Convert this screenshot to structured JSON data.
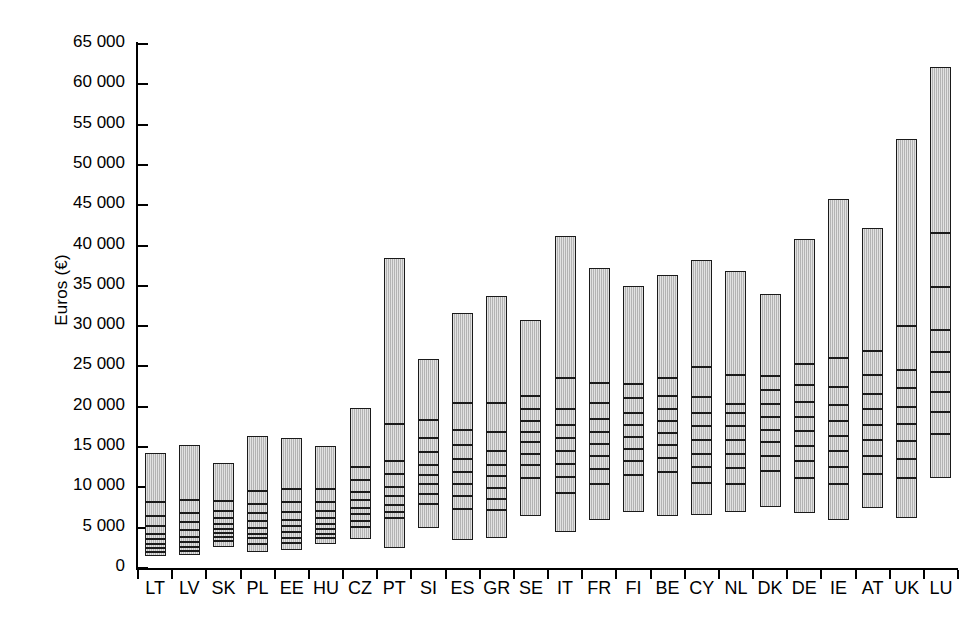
{
  "chart": {
    "ylabel": "Euros (€)",
    "xlabel": "",
    "ytick_labels": [
      "0",
      "5 000",
      "10 000",
      "15 000",
      "20 000",
      "25 000",
      "30 000",
      "35 000",
      "40 000",
      "45 000",
      "50 000",
      "55 000",
      "60 000",
      "65 000"
    ],
    "bar_fill_color": "#bfbfbf",
    "bar_edge_color": "#1a1a1a",
    "axis_color": "#000000",
    "background_color": "#ffffff"
  },
  "chart_data": {
    "type": "bar",
    "title": "",
    "subtitle": "",
    "xlabel": "",
    "ylabel": "Euros (€)",
    "ylim": [
      0,
      65000
    ],
    "ytick_values": [
      0,
      5000,
      10000,
      15000,
      20000,
      25000,
      30000,
      35000,
      40000,
      45000,
      50000,
      55000,
      60000,
      65000
    ],
    "ytick_labels": [
      "0",
      "5 000",
      "10 000",
      "15 000",
      "20 000",
      "25 000",
      "30 000",
      "35 000",
      "40 000",
      "45 000",
      "50 000",
      "55 000",
      "60 000",
      "65 000"
    ],
    "grid": false,
    "legend": null,
    "annotations": [],
    "note": "Floating range bars: each bar spans from the 1st decile to the 10th decile of earnings; internal horizontal lines mark intermediate deciles.",
    "categories": [
      "LT",
      "LV",
      "SK",
      "PL",
      "EE",
      "HU",
      "CZ",
      "PT",
      "SI",
      "ES",
      "GR",
      "SE",
      "IT",
      "FR",
      "FI",
      "BE",
      "CY",
      "NL",
      "DK",
      "DE",
      "IE",
      "AT",
      "UK",
      "LU"
    ],
    "series": [
      {
        "name": "Earnings decile range",
        "bars": [
          {
            "category": "LT",
            "low": 1500,
            "high": 14300,
            "deciles": [
              2100,
              2600,
              3100,
              3700,
              4400,
              5300,
              6600,
              8300
            ]
          },
          {
            "category": "LV",
            "low": 1600,
            "high": 15200,
            "deciles": [
              2200,
              2700,
              3300,
              4000,
              4800,
              5800,
              7000,
              8500
            ]
          },
          {
            "category": "SK",
            "low": 2600,
            "high": 13000,
            "deciles": [
              3500,
              4000,
              4500,
              5000,
              5600,
              6300,
              7200,
              8400
            ]
          },
          {
            "category": "PL",
            "low": 2000,
            "high": 16400,
            "deciles": [
              3100,
              3800,
              4400,
              5100,
              5900,
              6900,
              8100,
              9700
            ]
          },
          {
            "category": "EE",
            "low": 2200,
            "high": 16100,
            "deciles": [
              3200,
              3900,
              4600,
              5300,
              6100,
              7100,
              8300,
              9900
            ]
          },
          {
            "category": "HU",
            "low": 3000,
            "high": 15100,
            "deciles": [
              3900,
              4400,
              5000,
              5600,
              6300,
              7200,
              8300,
              9900
            ]
          },
          {
            "category": "CZ",
            "low": 3600,
            "high": 19800,
            "deciles": [
              5200,
              6000,
              6800,
              7600,
              8500,
              9600,
              11000,
              12600
            ]
          },
          {
            "category": "PT",
            "low": 2500,
            "high": 38500,
            "deciles": [
              6300,
              7100,
              8000,
              9000,
              10200,
              11800,
              13400,
              18000
            ]
          },
          {
            "category": "SI",
            "low": 5000,
            "high": 25900,
            "deciles": [
              8100,
              9300,
              10500,
              11700,
              12900,
              14500,
              16200,
              18500
            ]
          },
          {
            "category": "ES",
            "low": 3500,
            "high": 31600,
            "deciles": [
              7500,
              9000,
              10500,
              12000,
              13600,
              15400,
              17300,
              20600
            ]
          },
          {
            "category": "GR",
            "low": 3700,
            "high": 33800,
            "deciles": [
              7300,
              8700,
              10100,
              11500,
              12900,
              14600,
              17000,
              20600
            ]
          },
          {
            "category": "SE",
            "low": 6500,
            "high": 30800,
            "deciles": [
              11300,
              12900,
              14300,
              15700,
              17000,
              18300,
              19800,
              21500
            ]
          },
          {
            "category": "IT",
            "low": 4500,
            "high": 41200,
            "deciles": [
              9400,
              11400,
              13000,
              14600,
              16200,
              17900,
              19900,
              23700
            ]
          },
          {
            "category": "FR",
            "low": 6000,
            "high": 37200,
            "deciles": [
              10600,
              12400,
              14000,
              15500,
              17000,
              18600,
              20600,
              23100
            ]
          },
          {
            "category": "FI",
            "low": 7000,
            "high": 35000,
            "deciles": [
              11600,
              13400,
              14900,
              16400,
              17900,
              19400,
              21200,
              23000
            ]
          },
          {
            "category": "BE",
            "low": 6500,
            "high": 36300,
            "deciles": [
              12000,
              13800,
              15400,
              16900,
              18300,
              19800,
              21500,
              23700
            ]
          },
          {
            "category": "CY",
            "low": 6600,
            "high": 38200,
            "deciles": [
              10700,
              12600,
              14300,
              16000,
              17700,
              19400,
              21300,
              25000
            ]
          },
          {
            "category": "NL",
            "low": 7000,
            "high": 36800,
            "deciles": [
              10600,
              12500,
              14300,
              16000,
              17700,
              19400,
              20500,
              24100
            ]
          },
          {
            "category": "DK",
            "low": 7600,
            "high": 34000,
            "deciles": [
              12200,
              14000,
              15700,
              17300,
              18900,
              20500,
              22200,
              23900
            ]
          },
          {
            "category": "DE",
            "low": 6800,
            "high": 40800,
            "deciles": [
              11300,
              13400,
              15300,
              17100,
              18900,
              20700,
              22800,
              25400
            ]
          },
          {
            "category": "IE",
            "low": 6000,
            "high": 45800,
            "deciles": [
              10500,
              12600,
              14600,
              16500,
              18400,
              20400,
              22600,
              26200
            ]
          },
          {
            "category": "AT",
            "low": 7500,
            "high": 42200,
            "deciles": [
              11800,
              14000,
              16000,
              17900,
              19800,
              21700,
              24100,
              27000
            ]
          },
          {
            "category": "UK",
            "low": 6200,
            "high": 53200,
            "deciles": [
              11300,
              13700,
              15900,
              18000,
              20100,
              22400,
              24700,
              30200
            ]
          },
          {
            "category": "LU",
            "low": 11200,
            "high": 62200,
            "deciles": [
              16800,
              19500,
              22000,
              24400,
              26900,
              29600,
              35000,
              41700
            ]
          }
        ]
      }
    ]
  }
}
